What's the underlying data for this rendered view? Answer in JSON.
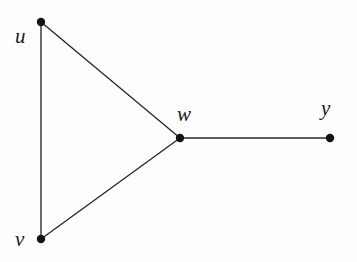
{
  "figure": {
    "kind": "undirected-graph-diagram",
    "background_color": "#fdfdfd",
    "ink_color": "#2b2b2b",
    "node_color": "#141414",
    "width": 357,
    "height": 262
  },
  "chart_data": {
    "type": "diagram",
    "title": "",
    "xlabel": "",
    "ylabel": "",
    "nodes": [
      {
        "id": "u",
        "label": "u",
        "x": 41,
        "y": 22,
        "label_x": 15,
        "label_y": 26,
        "degree": 2
      },
      {
        "id": "v",
        "label": "v",
        "x": 41,
        "y": 239,
        "label_x": 15,
        "label_y": 229,
        "degree": 2
      },
      {
        "id": "w",
        "label": "w",
        "x": 180,
        "y": 138,
        "label_x": 177,
        "label_y": 104,
        "degree": 3
      },
      {
        "id": "y",
        "label": "y",
        "x": 330,
        "y": 138,
        "label_x": 321,
        "label_y": 98,
        "degree": 1
      }
    ],
    "edges": [
      {
        "from": "u",
        "to": "v"
      },
      {
        "from": "u",
        "to": "w"
      },
      {
        "from": "v",
        "to": "w"
      },
      {
        "from": "w",
        "to": "y"
      }
    ],
    "node_radius": 4.2,
    "edge_width": 1.4,
    "node_count": 4,
    "edge_count": 4
  }
}
